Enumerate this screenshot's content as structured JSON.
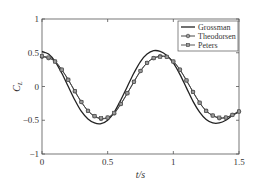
{
  "chart_data": {
    "type": "line",
    "title": "",
    "xlabel": "t/s",
    "ylabel": "C_L",
    "xlim": [
      0,
      1.5
    ],
    "ylim": [
      -1,
      1
    ],
    "x_ticks": [
      "0",
      "0.5",
      "1",
      "1.5"
    ],
    "y_ticks": [
      "-1",
      "-0.5",
      "0",
      "0.5",
      "1"
    ],
    "grid": false,
    "legend_position": "upper right",
    "legend": [
      "Grossman",
      "Theodorsen",
      "Peters"
    ],
    "x": [
      0,
      0.05,
      0.1,
      0.15,
      0.2,
      0.25,
      0.3,
      0.35,
      0.4,
      0.45,
      0.5,
      0.55,
      0.6,
      0.65,
      0.7,
      0.75,
      0.8,
      0.85,
      0.9,
      0.95,
      1.0,
      1.05,
      1.1,
      1.15,
      1.2,
      1.25,
      1.3,
      1.35,
      1.4,
      1.45,
      1.5
    ],
    "series": [
      {
        "name": "Grossman",
        "marker": "none",
        "values": [
          0.52,
          0.48,
          0.37,
          0.2,
          0.0,
          -0.2,
          -0.37,
          -0.48,
          -0.54,
          -0.55,
          -0.5,
          -0.38,
          -0.2,
          0.0,
          0.2,
          0.37,
          0.48,
          0.53,
          0.52,
          0.46,
          0.35,
          0.18,
          -0.02,
          -0.22,
          -0.38,
          -0.49,
          -0.54,
          -0.54,
          -0.5,
          -0.43,
          -0.37
        ]
      },
      {
        "name": "Theodorsen",
        "marker": "circle",
        "values": [
          0.44,
          0.42,
          0.37,
          0.25,
          0.1,
          -0.07,
          -0.23,
          -0.36,
          -0.44,
          -0.48,
          -0.46,
          -0.4,
          -0.26,
          -0.1,
          0.07,
          0.23,
          0.35,
          0.42,
          0.45,
          0.44,
          0.37,
          0.25,
          0.09,
          -0.08,
          -0.24,
          -0.36,
          -0.43,
          -0.47,
          -0.46,
          -0.42,
          -0.37
        ]
      },
      {
        "name": "Peters",
        "marker": "square",
        "values": [
          0.45,
          0.43,
          0.37,
          0.25,
          0.1,
          -0.07,
          -0.23,
          -0.36,
          -0.44,
          -0.47,
          -0.46,
          -0.39,
          -0.26,
          -0.1,
          0.07,
          0.23,
          0.35,
          0.42,
          0.44,
          0.44,
          0.37,
          0.25,
          0.09,
          -0.08,
          -0.24,
          -0.36,
          -0.43,
          -0.46,
          -0.46,
          -0.42,
          -0.37
        ]
      }
    ]
  },
  "colors": {
    "axis": "#555555",
    "grossman": "#222222",
    "theodorsen": "#333333",
    "peters": "#444444",
    "marker_fill": "#9a9a9a"
  },
  "layout": {
    "plot_left": 42,
    "plot_right": 239,
    "plot_top": 19,
    "plot_bottom": 154
  }
}
